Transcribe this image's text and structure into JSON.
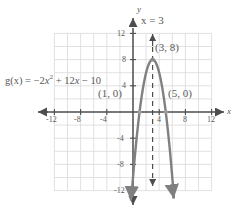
{
  "figure": {
    "name": "parabola-graph",
    "colors": {
      "curve": "#808080",
      "axis": "#4d4d4d",
      "grid": "#d9d9d9",
      "text": "#595959",
      "dashed": "#4d4d4d"
    },
    "axes": {
      "x_label": "x",
      "y_label": "y",
      "x_ticks": [
        "-12",
        "-8",
        "-4",
        "4",
        "8",
        "12"
      ],
      "x_tick_values": [
        -12,
        -8,
        -4,
        4,
        8,
        12
      ],
      "y_ticks": [
        "12",
        "8",
        "4",
        "-4",
        "-8",
        "-12"
      ],
      "y_tick_values": [
        12,
        8,
        4,
        -4,
        -8,
        -12
      ],
      "xlim": [
        -13,
        13
      ],
      "ylim": [
        -13,
        13
      ],
      "grid": true,
      "grid_step": 2
    },
    "annotations": {
      "equation": "g(x) = −2x² + 12x − 10",
      "equation_parts": {
        "prefix": "g(x) = −2",
        "var1": "x",
        "exponent": "2",
        "middle": " + 12",
        "var2": "x",
        "suffix": " − 10"
      },
      "axis_of_symmetry": "x = 3",
      "vertex_label": "(3, 8)",
      "root_left_label": "(1, 0)",
      "root_right_label": "(5, 0)"
    }
  },
  "chart_data": {
    "type": "line",
    "title": "",
    "xlabel": "x",
    "ylabel": "y",
    "xlim": [
      -13,
      13
    ],
    "ylim": [
      -13,
      13
    ],
    "grid": true,
    "function": "g(x) = -2x^2 + 12x - 10",
    "coefficients": {
      "a": -2,
      "b": 12,
      "c": -10
    },
    "vertex": [
      3,
      8
    ],
    "axis_of_symmetry": 3,
    "x_intercepts": [
      [
        1,
        0
      ],
      [
        5,
        0
      ]
    ],
    "y_intercept": [
      0,
      -10
    ],
    "series": [
      {
        "name": "g(x) = -2x^2 + 12x - 10",
        "x": [
          -0.1,
          0.25,
          0.6,
          0.95,
          1.3,
          1.65,
          2.0,
          2.35,
          2.7,
          3.0,
          3.3,
          3.65,
          4.0,
          4.35,
          4.7,
          5.05,
          5.4,
          5.75,
          6.1
        ],
        "y": [
          -11.22,
          -7.125,
          -3.52,
          -0.405,
          2.22,
          4.355,
          6.0,
          7.155,
          7.82,
          8.0,
          7.82,
          7.155,
          6.0,
          4.355,
          2.22,
          -0.405,
          -3.52,
          -7.125,
          -11.22
        ]
      }
    ],
    "annotations": [
      {
        "text": "x = 3",
        "x": 3,
        "y": 13.2
      },
      {
        "text": "(3, 8)",
        "x": 3.6,
        "y": 9.2
      },
      {
        "text": "(1, 0)",
        "x": -1.2,
        "y": 2.0
      },
      {
        "text": "(5, 0)",
        "x": 6.0,
        "y": 2.0
      },
      {
        "text": "g(x) = -2x^2 + 12x - 10",
        "x": -12.6,
        "y": 4.6
      }
    ]
  }
}
